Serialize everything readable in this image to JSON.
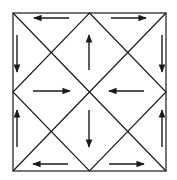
{
  "diagram": {
    "type": "square-with-diagonals-flow",
    "colors": {
      "stroke": "#1a1a1a",
      "background": "#ffffff"
    },
    "square": {
      "x1": 13,
      "y1": 13,
      "x2": 166,
      "y2": 171
    },
    "arrows": [
      {
        "name": "top-left-arrow-left",
        "x1": 69,
        "y1": 18,
        "x2": 34,
        "y2": 18
      },
      {
        "name": "top-right-arrow-right",
        "x1": 111,
        "y1": 18,
        "x2": 146,
        "y2": 18
      },
      {
        "name": "left-top-arrow-down",
        "x1": 17,
        "y1": 35,
        "x2": 17,
        "y2": 72
      },
      {
        "name": "right-top-arrow-down",
        "x1": 162,
        "y1": 35,
        "x2": 162,
        "y2": 72
      },
      {
        "name": "center-top-arrow-up",
        "x1": 89,
        "y1": 70,
        "x2": 89,
        "y2": 35
      },
      {
        "name": "center-left-arrow-right",
        "x1": 33,
        "y1": 91,
        "x2": 70,
        "y2": 91
      },
      {
        "name": "center-right-arrow-left",
        "x1": 144,
        "y1": 91,
        "x2": 109,
        "y2": 91
      },
      {
        "name": "center-bottom-arrow-down",
        "x1": 89,
        "y1": 110,
        "x2": 89,
        "y2": 147
      },
      {
        "name": "left-bottom-arrow-up",
        "x1": 17,
        "y1": 147,
        "x2": 17,
        "y2": 110
      },
      {
        "name": "right-bottom-arrow-up",
        "x1": 162,
        "y1": 147,
        "x2": 162,
        "y2": 110
      },
      {
        "name": "bottom-left-arrow-left",
        "x1": 68,
        "y1": 164,
        "x2": 33,
        "y2": 164
      },
      {
        "name": "bottom-right-arrow-right",
        "x1": 109,
        "y1": 164,
        "x2": 144,
        "y2": 164
      }
    ]
  }
}
